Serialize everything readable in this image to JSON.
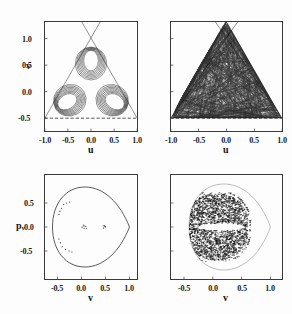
{
  "figure": {
    "background_color": "#fdfdfd",
    "ink_color": "#1b1b1b",
    "panel_count": 4
  },
  "panels": [
    {
      "id": "top-left",
      "position": "top-left",
      "xlabel": "u",
      "ylabel": "v",
      "xticks": [
        "-1.0",
        "-0.5",
        "0.0",
        "0.5",
        "1.0"
      ],
      "xtick_values": [
        -1.0,
        -0.5,
        0.0,
        0.5,
        1.0
      ],
      "yticks": [
        "1.0",
        "0.5",
        "0.0",
        "-0.5"
      ],
      "ytick_values": [
        1.0,
        0.5,
        0.0,
        -0.5
      ],
      "xlim": [
        -1.15,
        1.15
      ],
      "ylim": [
        -0.72,
        1.3
      ],
      "content": "regular-trefoil-orbit-in-triangular-billiard"
    },
    {
      "id": "top-right",
      "position": "top-right",
      "xlabel": "u",
      "ylabel": "",
      "xticks": [
        "-1.0",
        "-0.5",
        "0.0",
        "0.5",
        "1.0"
      ],
      "xtick_values": [
        -1.0,
        -0.5,
        0.0,
        0.5,
        1.0
      ],
      "yticks": [],
      "ytick_values": [],
      "xlim": [
        -1.15,
        1.15
      ],
      "ylim": [
        -0.72,
        1.3
      ],
      "content": "chaotic-orbit-filling-triangular-billiard"
    },
    {
      "id": "bottom-left",
      "position": "bottom-left",
      "xlabel": "v",
      "ylabel": "p",
      "ylabel_sub": "v",
      "xticks": [
        "-0.5",
        "0.0",
        "0.5",
        "1.0"
      ],
      "xtick_values": [
        -0.5,
        0.0,
        0.5,
        1.0
      ],
      "yticks": [
        "0.5",
        "0.0",
        "-0.5"
      ],
      "ytick_values": [
        0.5,
        0.0,
        -0.5
      ],
      "xlim": [
        -0.78,
        1.22
      ],
      "ylim": [
        -0.82,
        0.82
      ],
      "content": "poincare-section-regular-invariant-curve"
    },
    {
      "id": "bottom-right",
      "position": "bottom-right",
      "xlabel": "v",
      "ylabel": "",
      "xticks": [
        "-0.5",
        "0.0",
        "0.5",
        "1.0"
      ],
      "xtick_values": [
        -0.5,
        0.0,
        0.5,
        1.0
      ],
      "yticks": [],
      "ytick_values": [],
      "xlim": [
        -0.78,
        1.22
      ],
      "ylim": [
        -0.82,
        0.82
      ],
      "content": "poincare-section-chaotic-sea"
    }
  ],
  "chart_data": [
    {
      "type": "line",
      "panel": "top-left",
      "title": "",
      "xlabel": "u",
      "ylabel": "v",
      "xlim": [
        -1.15,
        1.15
      ],
      "ylim": [
        -0.72,
        1.3
      ],
      "xticks": [
        -1.0,
        -0.5,
        0.0,
        0.5,
        1.0
      ],
      "yticks": [
        -0.5,
        0.0,
        0.5,
        1.0
      ],
      "grid": false,
      "legend": "none",
      "annotations": [
        "equilateral triangle boundary drawn dashed/solid, sides extended past apex forming an X above the frame"
      ],
      "boundary": {
        "shape": "equilateral-triangle",
        "vertices": [
          [
            -1.0,
            -0.5
          ],
          [
            1.0,
            -0.5
          ],
          [
            0.0,
            1.232
          ]
        ],
        "bottom_side_style": "dashed",
        "slant_side_style": "solid-thin"
      },
      "series": [
        {
          "name": "regular quasiperiodic orbit",
          "style": "thin black line, multiply traced",
          "symmetry": "3-fold",
          "description": "three-lobed trefoil / clover orbit centered near (0,0.05), lobes reaching v~0.62 at top and v~-0.42 at bottom two lobes",
          "n_windings": 12,
          "lobe_centers": [
            [
              0.0,
              0.36
            ],
            [
              -0.31,
              -0.17
            ],
            [
              0.31,
              -0.17
            ]
          ],
          "lobe_radius": 0.27
        }
      ]
    },
    {
      "type": "line",
      "panel": "top-right",
      "title": "",
      "xlabel": "u",
      "ylabel": "",
      "xlim": [
        -1.15,
        1.15
      ],
      "ylim": [
        -0.72,
        1.3
      ],
      "xticks": [
        -1.0,
        -0.5,
        0.0,
        0.5,
        1.0
      ],
      "yticks": [],
      "grid": false,
      "legend": "none",
      "boundary": {
        "shape": "equilateral-triangle",
        "vertices": [
          [
            -1.0,
            -0.5
          ],
          [
            1.0,
            -0.5
          ],
          [
            0.0,
            1.232
          ]
        ],
        "bottom_side_style": "dashed",
        "slant_side_style": "solid-thin"
      },
      "series": [
        {
          "name": "chaotic orbit",
          "style": "thin black lines, densely ergodic",
          "description": "single trajectory densely filling the whole triangular region",
          "n_segments": 900,
          "fill_fraction": 0.95
        }
      ]
    },
    {
      "type": "scatter",
      "panel": "bottom-left",
      "title": "",
      "xlabel": "v",
      "ylabel": "p_v",
      "xlim": [
        -0.78,
        1.22
      ],
      "ylim": [
        -0.82,
        0.82
      ],
      "xticks": [
        -0.5,
        0.0,
        0.5,
        1.0
      ],
      "yticks": [
        -0.5,
        0.0,
        0.5
      ],
      "grid": false,
      "legend": "none",
      "boundary": {
        "shape": "teardrop-cusp-closed-curve",
        "description": "energy-boundary curve, rounded on the left, converging to a cusp point at (1.0, 0.0)",
        "cusp": [
          1.0,
          0.0
        ],
        "left_extent": -0.55,
        "top_extent": 0.58,
        "bottom_extent": -0.6
      },
      "series": [
        {
          "name": "regular orbit section points",
          "style": "small black dots",
          "description": "two tight island clusters near the center plus a sparse arc of points along the upper-left and lower-left inside of the boundary curve",
          "clusters": [
            {
              "center": [
                0.06,
                0.0
              ],
              "n": 6,
              "spread": 0.06
            },
            {
              "center": [
                0.48,
                0.0
              ],
              "n": 5,
              "spread": 0.05
            }
          ],
          "arc_points": [
            [
              -0.37,
              0.47
            ],
            [
              -0.31,
              0.5
            ],
            [
              -0.42,
              0.39
            ],
            [
              -0.45,
              0.33
            ],
            [
              -0.25,
              0.52
            ],
            [
              -0.47,
              0.26
            ],
            [
              -0.44,
              -0.33
            ],
            [
              -0.4,
              -0.41
            ],
            [
              -0.33,
              -0.47
            ],
            [
              -0.26,
              -0.5
            ],
            [
              -0.47,
              -0.25
            ],
            [
              -0.2,
              -0.52
            ]
          ]
        }
      ]
    },
    {
      "type": "scatter",
      "panel": "bottom-right",
      "title": "",
      "xlabel": "v",
      "ylabel": "",
      "xlim": [
        -0.78,
        1.22
      ],
      "ylim": [
        -0.82,
        0.82
      ],
      "xticks": [
        -0.5,
        0.0,
        0.5,
        1.0
      ],
      "yticks": [],
      "grid": false,
      "legend": "none",
      "boundary": {
        "shape": "teardrop-cusp-closed-curve",
        "cusp": [
          1.0,
          0.0
        ],
        "left_extent": -0.55,
        "top_extent": 0.58,
        "bottom_extent": -0.6
      },
      "series": [
        {
          "name": "chaotic sea section points",
          "style": "dense black dots",
          "n_points": 2600,
          "description": "chaotic sea densely filling the teardrop region, with an empty horizontal lens-shaped island gap centered near (0.15, 0.0) and a thin empty annulus just inside the left boundary",
          "void_island": {
            "center": [
              0.16,
              0.0
            ],
            "half_width": 0.4,
            "half_height": 0.075
          }
        }
      ]
    }
  ]
}
